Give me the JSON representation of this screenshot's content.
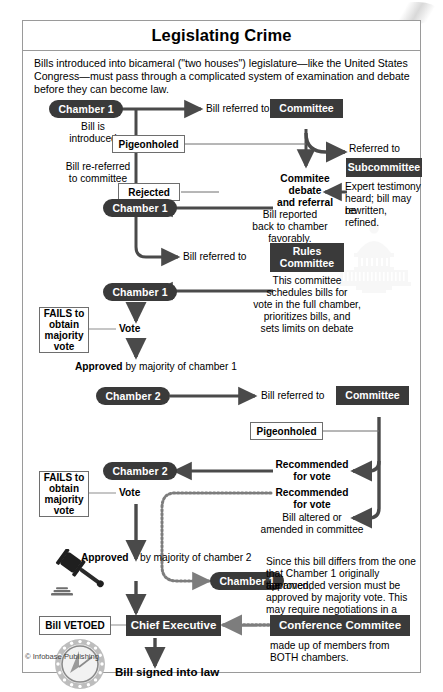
{
  "title": "Legislating Crime",
  "intro": "Bills introduced into bicameral (\"two houses\") legislature—like the United States Congress—must pass through a complicated system of examination and debate before they can become law.",
  "credit": "© Infobase Publishing",
  "colors": {
    "dark_node": "#3a3a3a",
    "arrow": "#4a4a4a",
    "frame": "#9a9a9a",
    "watermark": "#d9d9d9"
  },
  "nodes": {
    "chamber1_a": "Chamber 1",
    "chamber1_b": "Chamber 1",
    "chamber1_c": "Chamber 1",
    "chamber1_d": "Chamber 1",
    "chamber2_a": "Chamber 2",
    "chamber2_b": "Chamber 2",
    "committee_1": "Committee",
    "committee_2": "Committee",
    "subcommittee": "Subcommittee",
    "rules_committee": "Rules\nCommittee",
    "rules_committee_l1": "Rules",
    "rules_committee_l2": "Committee",
    "chief_executive": "Chief Executive",
    "conference_committee": "Conference Commitee"
  },
  "boxes": {
    "pigeonholed_1": "Pigeonholed",
    "pigeonholed_2": "Pigeonholed",
    "rejected": "Rejected",
    "fails_1_l1": "FAILS to",
    "fails_1_l2": "obtain",
    "fails_1_l3": "majority",
    "fails_1_l4": "vote",
    "fails_2_l1": "FAILS to",
    "fails_2_l2": "obtain",
    "fails_2_l3": "majority",
    "fails_2_l4": "vote",
    "bill_vetoed": "Bill VETOED"
  },
  "labels": {
    "bill_is_introduced_l1": "Bill is",
    "bill_is_introduced_l2": "introduced",
    "bill_re_referred_l1": "Bill re-referred",
    "bill_re_referred_l2": "to committee",
    "bill_referred_to_1": "Bill referred to",
    "bill_referred_to_2": "Bill referred to",
    "bill_referred_to_3": "Bill referred to",
    "referred_to": "Referred to",
    "expert_testimony_l1": "Expert testimony",
    "expert_testimony_l2": "heard; bill may be",
    "expert_testimony_l3": "rewritten, refined.",
    "committee_debate_l1": "Commitee",
    "committee_debate_l2": "debate",
    "committee_debate_l3": "and referral",
    "bill_reported_l1": "Bill reported",
    "bill_reported_l2": "back to chamber",
    "bill_reported_l3": "favorably.",
    "rules_desc_l1": "This committee",
    "rules_desc_l2": "schedules bills for",
    "rules_desc_l3": "vote in the full chamber,",
    "rules_desc_l4": "prioritizes bills, and",
    "rules_desc_l5": "sets limits on debate",
    "vote_1": "Vote",
    "vote_2": "Vote",
    "approved_1_bold": "Approved",
    "approved_1_rest": " by majority of chamber 1",
    "approved_2_bold": "Approved",
    "approved_2_rest": "by majority of chamber 2",
    "recommended_1_l1": "Recommended",
    "recommended_1_l2": "for vote",
    "recommended_2_l1": "Recommended",
    "recommended_2_l2": "for vote",
    "bill_altered_l1": "Bill altered or",
    "bill_altered_l2": "amended in committee",
    "conference_desc_l1": "Since this bill differs from the one",
    "conference_desc_l2": "that Chamber 1 originally approved,",
    "conference_desc_l3": "the amended version must be",
    "conference_desc_l4": "approved by majority vote. This",
    "conference_desc_l5": "may require negotiations in a",
    "conference_made_l1": "made up of members from",
    "conference_made_l2": "BOTH chambers.",
    "bill_signed": "Bill signed into law"
  },
  "icons": {
    "capitol": "capitol-building-icon",
    "gavel": "gavel-icon",
    "seal": "presidential-seal-icon"
  }
}
